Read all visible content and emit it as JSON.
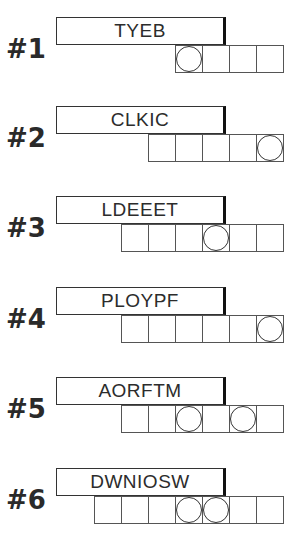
{
  "puzzles": [
    {
      "number": "#1",
      "clue": "TYEB",
      "length": 4,
      "circled": [
        0
      ]
    },
    {
      "number": "#2",
      "clue": "CLKIC",
      "length": 5,
      "circled": [
        4
      ]
    },
    {
      "number": "#3",
      "clue": "LDEEET",
      "length": 6,
      "circled": [
        3
      ]
    },
    {
      "number": "#4",
      "clue": "PLOYPF",
      "length": 6,
      "circled": [
        5
      ]
    },
    {
      "number": "#5",
      "clue": "AORFTM",
      "length": 6,
      "circled": [
        2,
        4
      ]
    },
    {
      "number": "#6",
      "clue": "DWNIOSW",
      "length": 7,
      "circled": [
        3,
        4
      ]
    }
  ]
}
